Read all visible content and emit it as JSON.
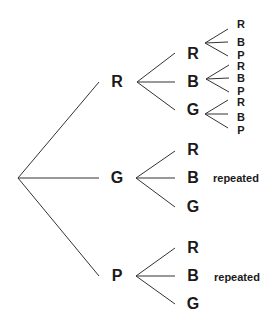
{
  "diagram": {
    "type": "probability-tree",
    "level1": [
      {
        "label": "R",
        "x": 117,
        "y": 82
      },
      {
        "label": "G",
        "x": 117,
        "y": 178
      },
      {
        "label": "P",
        "x": 117,
        "y": 276
      }
    ],
    "level2": {
      "R": [
        {
          "label": "R",
          "x": 193,
          "y": 54
        },
        {
          "label": "B",
          "x": 193,
          "y": 82
        },
        {
          "label": "G",
          "x": 193,
          "y": 110
        }
      ],
      "G": [
        {
          "label": "R",
          "x": 193,
          "y": 150
        },
        {
          "label": "B",
          "x": 193,
          "y": 178
        },
        {
          "label": "G",
          "x": 193,
          "y": 207
        }
      ],
      "P": [
        {
          "label": "R",
          "x": 193,
          "y": 248
        },
        {
          "label": "B",
          "x": 193,
          "y": 276
        },
        {
          "label": "G",
          "x": 193,
          "y": 304
        }
      ]
    },
    "level3": {
      "RR": [
        {
          "label": "R"
        },
        {
          "label": "B"
        },
        {
          "label": "P"
        }
      ],
      "RB": [
        {
          "label": "R"
        },
        {
          "label": "B"
        },
        {
          "label": "P"
        }
      ],
      "RG": [
        {
          "label": "R"
        },
        {
          "label": "B"
        },
        {
          "label": "P"
        }
      ]
    },
    "notes": {
      "G_branch": "repeated",
      "P_branch": "repeated"
    },
    "line_color": "#333333"
  }
}
